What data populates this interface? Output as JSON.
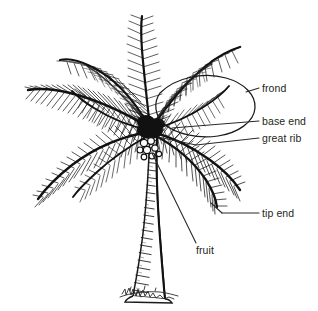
{
  "figure": {
    "style": "black-ink-pen-and-ink-illustration",
    "background_color": "#ffffff",
    "ink_color": "#1a1a1a",
    "label_color": "#231f20",
    "leader_line_color": "#2a2a2a"
  },
  "labels": [
    {
      "id": "frond",
      "text": "frond",
      "x": 262,
      "y": 83,
      "leader_from": [
        260,
        89
      ],
      "leader_to": [
        246,
        89
      ]
    },
    {
      "id": "base_end",
      "text": "base end",
      "x": 262,
      "y": 116,
      "leader_from": [
        260,
        122
      ],
      "leader_to": [
        171,
        128
      ]
    },
    {
      "id": "great_rib",
      "text": "great rib",
      "x": 262,
      "y": 133,
      "leader_from": [
        260,
        139
      ],
      "leader_to": [
        150,
        143
      ]
    },
    {
      "id": "tip_end",
      "text": "tip end",
      "x": 262,
      "y": 208,
      "leader_from": [
        260,
        214
      ],
      "leader_to": [
        213,
        214
      ]
    },
    {
      "id": "fruit",
      "text": "fruit",
      "x": 196,
      "y": 245,
      "leader_from": [
        196,
        243
      ],
      "leader_to": [
        150,
        151
      ]
    }
  ],
  "annotations": {
    "frond_outline": {
      "shape": "hand-drawn-ellipse",
      "center_x": 196,
      "center_y": 105,
      "radius_x": 58,
      "radius_y": 30,
      "rotation_deg": -8
    },
    "signature": {
      "present": true,
      "text": "",
      "x": 128,
      "y": 290,
      "description": "artist signature scribble at trunk base"
    }
  },
  "parts": {
    "crown": {
      "label": "crown of fronds",
      "top": 14,
      "bottom": 205,
      "left": 24,
      "right": 252
    },
    "trunk": {
      "label": "trunk",
      "top": 128,
      "bottom": 300,
      "segments": 22
    },
    "fruit_cluster": {
      "label": "coconut fruit cluster",
      "x": 148,
      "y": 148
    }
  }
}
